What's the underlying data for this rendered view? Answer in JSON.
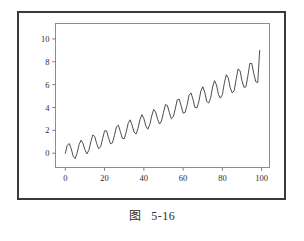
{
  "figure": {
    "caption_label": "图",
    "caption_number": "5-16"
  },
  "chart_data": {
    "type": "line",
    "title": "",
    "xlabel": "",
    "ylabel": "",
    "xlim": [
      -5,
      104
    ],
    "ylim": [
      -1.25,
      11.35
    ],
    "grid": false,
    "legend": null,
    "line_color": "#3b3b3d",
    "line_width": 0.9,
    "xticks": [
      0,
      20,
      40,
      60,
      80,
      100
    ],
    "xticklabels": [
      "0",
      "20",
      "40",
      "60",
      "80",
      "100"
    ],
    "yticks": [
      0,
      2,
      4,
      6,
      8,
      10
    ],
    "yticklabels": [
      "0",
      "2",
      "4",
      "6",
      "8",
      "10"
    ],
    "series": [
      {
        "name": "signal",
        "x": [
          0,
          1,
          2,
          3,
          4,
          5,
          6,
          7,
          8,
          9,
          10,
          11,
          12,
          13,
          14,
          15,
          16,
          17,
          18,
          19,
          20,
          21,
          22,
          23,
          24,
          25,
          26,
          27,
          28,
          29,
          30,
          31,
          32,
          33,
          34,
          35,
          36,
          37,
          38,
          39,
          40,
          41,
          42,
          43,
          44,
          45,
          46,
          47,
          48,
          49,
          50,
          51,
          52,
          53,
          54,
          55,
          56,
          57,
          58,
          59,
          60,
          61,
          62,
          63,
          64,
          65,
          66,
          67,
          68,
          69,
          70,
          71,
          72,
          73,
          74,
          75,
          76,
          77,
          78,
          79,
          80,
          81,
          82,
          83,
          84,
          85,
          86,
          87,
          88,
          89,
          90,
          91,
          92,
          93,
          94,
          95,
          96,
          97,
          98,
          99
        ],
        "y": [
          0.0,
          0.69,
          0.85,
          0.4,
          -0.26,
          -0.48,
          0.01,
          0.75,
          1.14,
          0.86,
          0.3,
          -0.06,
          0.26,
          1.0,
          1.6,
          1.45,
          0.83,
          0.39,
          0.58,
          1.27,
          1.96,
          1.96,
          1.35,
          0.82,
          0.9,
          1.55,
          2.3,
          2.45,
          1.91,
          1.32,
          1.27,
          1.84,
          2.61,
          2.92,
          2.47,
          1.85,
          1.68,
          2.15,
          2.93,
          3.38,
          3.04,
          2.4,
          2.1,
          2.48,
          3.25,
          3.83,
          3.61,
          2.97,
          2.55,
          2.82,
          3.56,
          4.26,
          4.17,
          3.55,
          3.01,
          3.18,
          3.87,
          4.67,
          4.73,
          4.14,
          3.5,
          3.56,
          4.18,
          5.06,
          5.28,
          4.74,
          4.02,
          3.96,
          4.49,
          5.43,
          5.82,
          5.35,
          4.56,
          4.38,
          4.81,
          5.79,
          6.35,
          5.97,
          5.13,
          4.82,
          5.13,
          6.13,
          6.87,
          6.59,
          5.72,
          5.28,
          5.46,
          6.45,
          7.38,
          7.22,
          6.33,
          5.76,
          5.81,
          6.77,
          7.87,
          7.85,
          6.96,
          6.26,
          6.18,
          9.0
        ],
        "markers": false
      }
    ],
    "annotations": []
  }
}
